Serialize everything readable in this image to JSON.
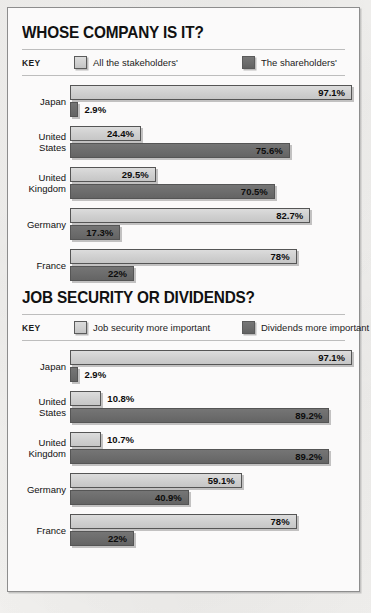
{
  "chart_data": [
    {
      "type": "bar",
      "title": "WHOSE COMPANY IS IT?",
      "orientation": "horizontal",
      "grouped": true,
      "key_label": "KEY",
      "xlabel": "",
      "ylabel": "",
      "xlim": [
        0,
        100
      ],
      "grid": false,
      "legend_position": "top",
      "categories": [
        "Japan",
        "United States",
        "United Kingdom",
        "Germany",
        "France"
      ],
      "series": [
        {
          "name": "All the stakeholders'",
          "color": "#cfcfcf",
          "values": [
            97.1,
            24.4,
            29.5,
            82.7,
            78
          ],
          "labels": [
            "97.1%",
            "24.4%",
            "29.5%",
            "82.7%",
            "78%"
          ]
        },
        {
          "name": "The shareholders'",
          "color": "#6c6c6c",
          "values": [
            2.9,
            75.6,
            70.5,
            17.3,
            22
          ],
          "labels": [
            "2.9%",
            "75.6%",
            "70.5%",
            "17.3%",
            "22%"
          ]
        }
      ]
    },
    {
      "type": "bar",
      "title": "JOB SECURITY OR DIVIDENDS?",
      "orientation": "horizontal",
      "grouped": true,
      "key_label": "KEY",
      "xlabel": "",
      "ylabel": "",
      "xlim": [
        0,
        100
      ],
      "grid": false,
      "legend_position": "top",
      "categories": [
        "Japan",
        "United States",
        "United Kingdom",
        "Germany",
        "France"
      ],
      "series": [
        {
          "name": "Job security more important",
          "color": "#cfcfcf",
          "values": [
            97.1,
            10.8,
            10.7,
            59.1,
            78
          ],
          "labels": [
            "97.1%",
            "10.8%",
            "10.7%",
            "59.1%",
            "78%"
          ]
        },
        {
          "name": "Dividends more important",
          "color": "#6c6c6c",
          "values": [
            2.9,
            89.2,
            89.2,
            40.9,
            22
          ],
          "labels": [
            "2.9%",
            "89.2%",
            "89.2%",
            "40.9%",
            "22%"
          ]
        }
      ]
    }
  ]
}
